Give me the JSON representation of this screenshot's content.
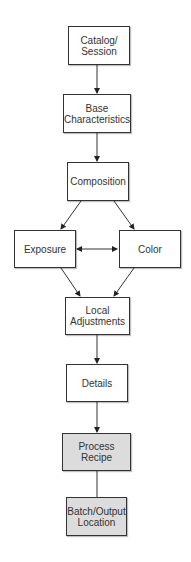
{
  "diagram": {
    "type": "flowchart",
    "nodes": [
      {
        "id": "catalog",
        "label": "Catalog/\nSession",
        "line1": "Catalog/",
        "line2": "Session",
        "fill": "#ffffff"
      },
      {
        "id": "base",
        "label": "Base Characteristics",
        "line1": "Base",
        "line2": "Characteristics",
        "fill": "#ffffff"
      },
      {
        "id": "composition",
        "label": "Composition",
        "line1": "Composition",
        "fill": "#ffffff"
      },
      {
        "id": "exposure",
        "label": "Exposure",
        "line1": "Exposure",
        "fill": "#ffffff"
      },
      {
        "id": "color",
        "label": "Color",
        "line1": "Color",
        "fill": "#ffffff"
      },
      {
        "id": "local",
        "label": "Local Adjustments",
        "line1": "Local",
        "line2": "Adjustments",
        "fill": "#ffffff"
      },
      {
        "id": "details",
        "label": "Details",
        "line1": "Details",
        "fill": "#ffffff"
      },
      {
        "id": "recipe",
        "label": "Process Recipe",
        "line1": "Process",
        "line2": "Recipe",
        "fill": "#dcdcdc"
      },
      {
        "id": "batch",
        "label": "Batch/Output Location",
        "line1": "Batch/Output",
        "line2": "Location",
        "fill": "#dcdcdc"
      }
    ],
    "edges": [
      {
        "from": "catalog",
        "to": "base",
        "arrow": true
      },
      {
        "from": "base",
        "to": "composition",
        "arrow": true
      },
      {
        "from": "composition",
        "to": "exposure",
        "arrow": true
      },
      {
        "from": "composition",
        "to": "color",
        "arrow": true
      },
      {
        "from": "exposure",
        "to": "color",
        "arrow": "both"
      },
      {
        "from": "exposure",
        "to": "local",
        "arrow": true
      },
      {
        "from": "color",
        "to": "local",
        "arrow": true
      },
      {
        "from": "local",
        "to": "details",
        "arrow": true
      },
      {
        "from": "details",
        "to": "recipe",
        "arrow": true
      },
      {
        "from": "recipe",
        "to": "batch",
        "arrow": false
      }
    ]
  }
}
